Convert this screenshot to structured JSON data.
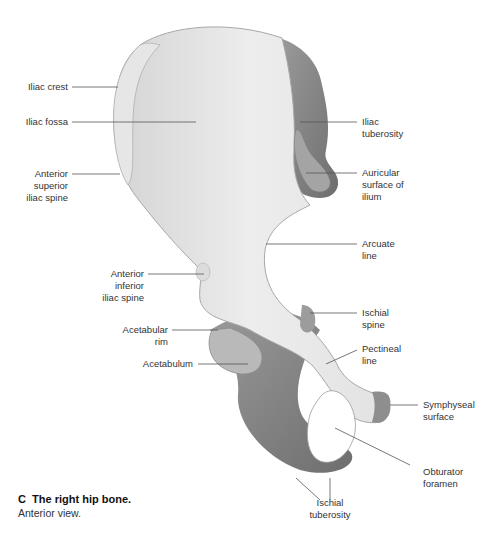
{
  "figure": {
    "caption": {
      "letter": "C",
      "title": "The right hip bone.",
      "subtitle": "Anterior view."
    },
    "labels": {
      "iliac_crest": "Iliac crest",
      "iliac_fossa": "Iliac fossa",
      "asis": "Anterior\nsuperior\niliac spine",
      "iliac_tuberosity": "Iliac\ntuberosity",
      "auricular_surface": "Auricular\nsurface of\nilium",
      "arcuate_line": "Arcuate\nline",
      "aiis": "Anterior\ninferior\niliac spine",
      "acetabular_rim": "Acetabular\nrim",
      "acetabulum": "Acetabulum",
      "ischial_spine": "Ischial\nspine",
      "pectineal_line": "Pectineal\nline",
      "symphyseal_surface": "Symphyseal\nsurface",
      "obturator_foramen": "Obturator\nforamen",
      "ischial_tuberosity": "Ischial\ntuberosity"
    },
    "colors": {
      "bone_light": "#ececec",
      "bone_mid": "#cfcfcf",
      "bone_dark": "#8a8a8a",
      "leader_line": "#555555"
    }
  }
}
